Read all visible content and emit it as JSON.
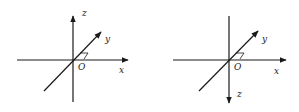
{
  "figures": [
    {
      "name": "left-coordinate-system",
      "description": "z-axis pointing up",
      "labels": {
        "x": "x",
        "y": "y",
        "z": "z",
        "origin": "O"
      }
    },
    {
      "name": "right-coordinate-system",
      "description": "z-axis pointing down",
      "labels": {
        "x": "x",
        "y": "y",
        "z": "z",
        "origin": "O"
      }
    }
  ],
  "colors": {
    "axis": "#1a1a1a",
    "background": "#ffffff"
  }
}
